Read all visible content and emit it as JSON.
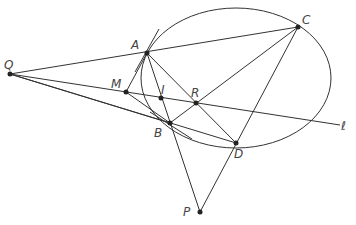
{
  "diagram": {
    "type": "geometry",
    "stroke_color": "#333333",
    "points": [
      {
        "name": "Q",
        "x": 10,
        "y": 74,
        "lx": 4,
        "ly": 69
      },
      {
        "name": "A",
        "x": 147,
        "y": 53,
        "lx": 131,
        "ly": 49
      },
      {
        "name": "C",
        "x": 298,
        "y": 27,
        "lx": 302,
        "ly": 24
      },
      {
        "name": "M",
        "x": 126,
        "y": 92,
        "lx": 111,
        "ly": 88
      },
      {
        "name": "I",
        "x": 161,
        "y": 98,
        "lx": 161,
        "ly": 94
      },
      {
        "name": "R",
        "x": 196,
        "y": 103,
        "lx": 191,
        "ly": 97
      },
      {
        "name": "B",
        "x": 170,
        "y": 123,
        "lx": 154,
        "ly": 137
      },
      {
        "name": "D",
        "x": 236,
        "y": 143,
        "lx": 234,
        "ly": 158
      },
      {
        "name": "P",
        "x": 200,
        "y": 212,
        "lx": 183,
        "ly": 216
      }
    ],
    "line_label": {
      "name": "ℓ",
      "x": 341,
      "y": 130
    },
    "ellipse": {
      "cx": 236,
      "cy": 78,
      "rx": 95,
      "ry": 70
    }
  }
}
